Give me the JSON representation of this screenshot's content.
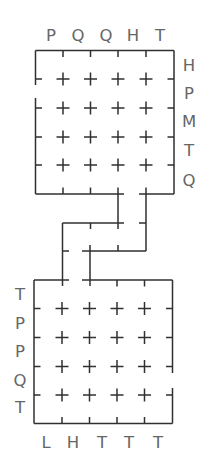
{
  "puzzle": {
    "top_grid": {
      "column_labels": [
        "P",
        "Q",
        "Q",
        "H",
        "T"
      ],
      "row_labels": [
        "H",
        "P",
        "M",
        "T",
        "Q"
      ]
    },
    "bottom_grid": {
      "row_labels": [
        "T",
        "P",
        "P",
        "Q",
        "T"
      ],
      "column_labels": [
        "L",
        "H",
        "T",
        "T",
        "T"
      ]
    }
  },
  "colors": {
    "background": "#ffffff",
    "line": "#303030",
    "label": "#666666"
  }
}
